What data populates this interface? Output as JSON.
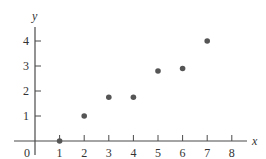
{
  "chart_data": {
    "type": "scatter",
    "title": "",
    "xlabel": "x",
    "ylabel": "y",
    "xlim": [
      0,
      8
    ],
    "ylim": [
      0,
      4
    ],
    "x_ticks": [
      "1",
      "2",
      "3",
      "4",
      "5",
      "6",
      "7",
      "8"
    ],
    "y_ticks": [
      "1",
      "2",
      "3",
      "4"
    ],
    "origin_label": "0",
    "grid": false,
    "legend": null,
    "points": [
      {
        "x": 1,
        "y": 0
      },
      {
        "x": 2,
        "y": 1
      },
      {
        "x": 3,
        "y": 1.75
      },
      {
        "x": 4,
        "y": 1.75
      },
      {
        "x": 5,
        "y": 2.8
      },
      {
        "x": 6,
        "y": 2.9
      },
      {
        "x": 7,
        "y": 4
      }
    ],
    "point_color": "#555555",
    "axis_color": "#4a4a4a"
  }
}
